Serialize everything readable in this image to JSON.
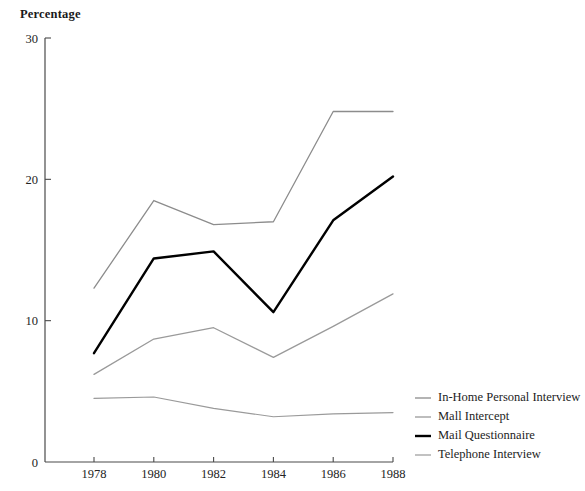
{
  "chart_data": {
    "type": "line",
    "title": "Percentage",
    "xlabel": "",
    "ylabel": "Percentage",
    "categories": [
      "1978",
      "1980",
      "1982",
      "1984",
      "1986",
      "1988"
    ],
    "x": [
      1978,
      1980,
      1982,
      1984,
      1986,
      1988
    ],
    "xlim": [
      1977.2,
      1988.6
    ],
    "ylim": [
      0,
      30
    ],
    "yticks": [
      0,
      10,
      20,
      30
    ],
    "ytick_labels": [
      "0",
      "10",
      "20",
      "30"
    ],
    "xticks": [
      1978,
      1980,
      1982,
      1984,
      1986,
      1988
    ],
    "xtick_labels": [
      "1978",
      "1980",
      "1982",
      "1984",
      "1986",
      "1988"
    ],
    "grid": false,
    "legend_position": "right",
    "series": [
      {
        "name": "In-Home Personal Interview",
        "color": "#8c8c8c",
        "width": 1.3,
        "values": [
          12.3,
          18.5,
          16.8,
          17.0,
          24.8,
          24.8
        ]
      },
      {
        "name": "Mall Intercept",
        "color": "#9a9a9a",
        "width": 1.3,
        "values": [
          6.2,
          8.7,
          9.5,
          7.4,
          9.6,
          11.9
        ]
      },
      {
        "name": "Mail Questionnaire",
        "color": "#000000",
        "width": 2.4,
        "values": [
          7.7,
          14.4,
          14.9,
          10.6,
          17.1,
          20.2
        ]
      },
      {
        "name": "Telephone Interview",
        "color": "#9a9a9a",
        "width": 1.2,
        "values": [
          4.5,
          4.6,
          3.8,
          3.2,
          3.4,
          3.5
        ]
      }
    ]
  },
  "legend": {
    "items": [
      {
        "label": "In-Home Personal Interview"
      },
      {
        "label": "Mall Intercept"
      },
      {
        "label": "Mail Questionnaire"
      },
      {
        "label": "Telephone Interview"
      }
    ]
  },
  "axes": {
    "axis_color": "#4a4a4a",
    "tick_color": "#4a4a4a"
  }
}
